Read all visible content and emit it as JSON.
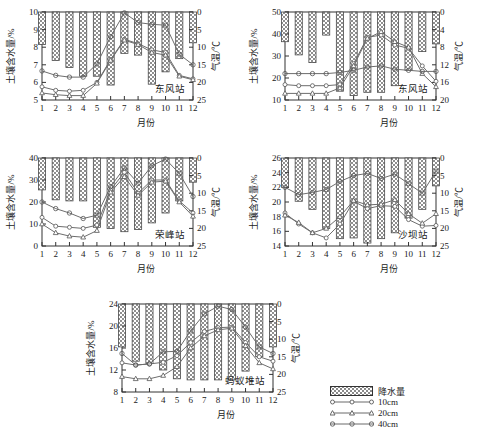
{
  "figure": {
    "axis_labels": {
      "y_left": "土壤含水量/%",
      "y_right": "气温/℃",
      "x": "月份"
    }
  },
  "legend": {
    "items": [
      {
        "label": "降水量",
        "type": "bar",
        "icon": "hatched-bar-swatch"
      },
      {
        "label": "10cm",
        "type": "line",
        "icon": "circle-marker-line"
      },
      {
        "label": "20cm",
        "type": "line",
        "icon": "triangle-marker-line"
      },
      {
        "label": "40cm",
        "type": "line",
        "icon": "circle-open-marker-line"
      }
    ]
  },
  "chart_data": [
    {
      "type": "bar",
      "title": "",
      "station": "东风站",
      "panel_index": 0,
      "xlabel": "月份",
      "ylabel": "土壤含水量/%",
      "y2label": "气温/℃",
      "categories": [
        "1",
        "2",
        "3",
        "4",
        "5",
        "6",
        "7",
        "8",
        "9",
        "10",
        "11",
        "12"
      ],
      "x": [
        1,
        2,
        3,
        4,
        5,
        6,
        7,
        8,
        9,
        10,
        11,
        12
      ],
      "ylim": [
        5,
        10
      ],
      "yticks": [
        5,
        6,
        7,
        8,
        9,
        10
      ],
      "y2lim": [
        25,
        0
      ],
      "y2ticks": [
        0,
        5,
        10,
        15,
        20,
        25
      ],
      "grid": false,
      "legend_position": "outside-bottom-right",
      "bars": {
        "name": "降水量",
        "anchor": "top",
        "values_bottom": [
          8.15,
          7.25,
          6.85,
          6.35,
          6.35,
          5.85,
          7.65,
          7.55,
          5.9,
          6.6,
          7.35,
          8.25
        ]
      },
      "series": [
        {
          "name": "10cm",
          "marker": "circle",
          "values": [
            5.75,
            5.55,
            5.5,
            5.55,
            6.0,
            7.3,
            8.45,
            8.2,
            7.85,
            7.7,
            6.4,
            6.2
          ]
        },
        {
          "name": "20cm",
          "marker": "triangle",
          "values": [
            5.4,
            5.3,
            5.25,
            5.25,
            5.95,
            7.25,
            8.4,
            8.15,
            7.7,
            7.55,
            6.35,
            6.15
          ]
        },
        {
          "name": "40cm",
          "marker": "circle-open",
          "values": [
            6.65,
            6.4,
            6.3,
            6.3,
            7.05,
            8.6,
            9.95,
            9.4,
            9.3,
            9.25,
            7.6,
            7.0
          ]
        }
      ]
    },
    {
      "type": "bar",
      "title": "",
      "station": "东风站",
      "panel_index": 1,
      "xlabel": "月份",
      "ylabel": "土壤含水量/%",
      "y2label": "气温/℃",
      "categories": [
        "1",
        "2",
        "3",
        "4",
        "5",
        "6",
        "7",
        "8",
        "9",
        "10",
        "11",
        "12"
      ],
      "x": [
        1,
        2,
        3,
        4,
        5,
        6,
        7,
        8,
        9,
        10,
        11,
        12
      ],
      "ylim": [
        10,
        50
      ],
      "yticks": [
        10,
        20,
        30,
        40,
        50
      ],
      "y2lim": [
        20,
        0
      ],
      "y2ticks": [
        0,
        4,
        8,
        12,
        16,
        20
      ],
      "grid": false,
      "legend_position": "outside-bottom-right",
      "bars": {
        "name": "降水量",
        "anchor": "top",
        "values_bottom": [
          36.5,
          30.5,
          27.0,
          39.5,
          14.0,
          12.0,
          13.5,
          13.5,
          16.5,
          23.5,
          32.0,
          35.5
        ]
      },
      "series": [
        {
          "name": "10cm",
          "marker": "circle",
          "values": [
            17.0,
            16.5,
            16.5,
            16.5,
            17.0,
            26.5,
            38.5,
            39.5,
            35.0,
            33.5,
            25.5,
            18.5
          ]
        },
        {
          "name": "20cm",
          "marker": "triangle",
          "values": [
            13.0,
            13.0,
            13.0,
            13.0,
            15.5,
            25.5,
            38.0,
            41.0,
            36.5,
            34.0,
            22.0,
            16.0
          ]
        },
        {
          "name": "40cm",
          "marker": "circle-open",
          "values": [
            22.0,
            22.0,
            22.0,
            22.0,
            22.5,
            23.5,
            25.0,
            25.5,
            24.0,
            23.5,
            23.0,
            23.0
          ]
        }
      ]
    },
    {
      "type": "bar",
      "title": "",
      "station": "荣峰站",
      "panel_index": 2,
      "xlabel": "月份",
      "ylabel": "土壤含水量/%",
      "y2label": "气温/℃",
      "categories": [
        "1",
        "2",
        "3",
        "4",
        "5",
        "6",
        "7",
        "8",
        "9",
        "10",
        "11",
        "12"
      ],
      "x": [
        1,
        2,
        3,
        4,
        5,
        6,
        7,
        8,
        9,
        10,
        11,
        12
      ],
      "ylim": [
        0,
        40
      ],
      "yticks": [
        0,
        10,
        20,
        30,
        40
      ],
      "y2lim": [
        25,
        0
      ],
      "y2ticks": [
        0,
        5,
        10,
        15,
        20,
        25
      ],
      "grid": false,
      "legend_position": "outside-bottom-right",
      "bars": {
        "name": "降水量",
        "anchor": "top",
        "values_bottom": [
          25.5,
          21.0,
          20.5,
          20.5,
          8.5,
          8.0,
          6.5,
          7.5,
          10.5,
          15.0,
          20.5,
          29.0
        ]
      },
      "series": [
        {
          "name": "10cm",
          "marker": "circle",
          "values": [
            13.0,
            9.0,
            8.5,
            8.0,
            9.5,
            25.5,
            33.5,
            24.0,
            30.0,
            30.0,
            20.5,
            15.0
          ]
        },
        {
          "name": "20cm",
          "marker": "triangle",
          "values": [
            10.0,
            6.0,
            4.5,
            4.0,
            7.0,
            24.5,
            31.5,
            23.0,
            29.0,
            29.5,
            20.0,
            13.5
          ]
        },
        {
          "name": "40cm",
          "marker": "circle-open",
          "values": [
            20.0,
            17.0,
            15.0,
            12.5,
            14.0,
            27.0,
            35.5,
            28.5,
            36.5,
            39.5,
            33.0,
            22.5
          ]
        }
      ]
    },
    {
      "type": "bar",
      "title": "",
      "station": "沙坝站",
      "panel_index": 3,
      "xlabel": "月份",
      "ylabel": "土壤含水量/%",
      "y2label": "气温/℃",
      "categories": [
        "1",
        "2",
        "3",
        "4",
        "5",
        "6",
        "7",
        "8",
        "9",
        "10",
        "11",
        "12"
      ],
      "x": [
        1,
        2,
        3,
        4,
        5,
        6,
        7,
        8,
        9,
        10,
        11,
        12
      ],
      "ylim": [
        14,
        26
      ],
      "yticks": [
        14,
        16,
        18,
        20,
        22,
        24,
        26
      ],
      "y2lim": [
        25,
        0
      ],
      "y2ticks": [
        0,
        5,
        10,
        15,
        20,
        25
      ],
      "grid": false,
      "legend_position": "outside-bottom-right",
      "bars": {
        "name": "降水量",
        "anchor": "top",
        "values_bottom": [
          22.0,
          20.1,
          19.0,
          16.4,
          15.0,
          15.1,
          14.4,
          15.0,
          15.8,
          17.8,
          19.0,
          22.2
        ]
      },
      "series": [
        {
          "name": "10cm",
          "marker": "circle",
          "values": [
            18.5,
            17.0,
            15.8,
            15.1,
            17.0,
            20.1,
            19.1,
            19.5,
            19.4,
            17.6,
            16.7,
            16.8
          ]
        },
        {
          "name": "20cm",
          "marker": "triangle",
          "values": [
            18.2,
            17.2,
            15.8,
            16.4,
            18.0,
            20.2,
            19.6,
            19.7,
            20.3,
            18.4,
            17.1,
            18.4
          ]
        },
        {
          "name": "40cm",
          "marker": "circle-open",
          "values": [
            22.0,
            21.0,
            21.3,
            21.7,
            22.8,
            23.6,
            23.9,
            23.2,
            23.8,
            22.5,
            21.2,
            24.2
          ]
        }
      ]
    },
    {
      "type": "bar",
      "title": "",
      "station": "蚂蚁堆站",
      "panel_index": 4,
      "xlabel": "月份",
      "ylabel": "土壤含水量/%",
      "y2label": "气温/℃",
      "categories": [
        "1",
        "2",
        "3",
        "4",
        "5",
        "6",
        "7",
        "8",
        "9",
        "10",
        "11",
        "12"
      ],
      "x": [
        1,
        2,
        3,
        4,
        5,
        6,
        7,
        8,
        9,
        10,
        11,
        12
      ],
      "ylim": [
        8,
        24
      ],
      "yticks": [
        8,
        12,
        16,
        20,
        24
      ],
      "y2lim": [
        25,
        0
      ],
      "y2ticks": [
        0,
        5,
        10,
        15,
        20,
        25
      ],
      "grid": false,
      "legend_position": "outside-bottom-right",
      "bars": {
        "name": "降水量",
        "anchor": "top",
        "values_bottom": [
          16.2,
          13.6,
          13.2,
          12.0,
          10.4,
          10.2,
          10.2,
          10.2,
          10.2,
          11.8,
          14.4,
          16.2
        ]
      },
      "series": [
        {
          "name": "10cm",
          "marker": "circle",
          "values": [
            13.3,
            12.9,
            13.1,
            13.4,
            14.6,
            17.0,
            19.0,
            19.7,
            19.8,
            17.0,
            14.4,
            13.6
          ]
        },
        {
          "name": "20cm",
          "marker": "triangle",
          "values": [
            10.8,
            10.4,
            10.4,
            11.0,
            12.6,
            16.0,
            18.2,
            19.3,
            19.6,
            16.4,
            13.3,
            12.2
          ]
        },
        {
          "name": "40cm",
          "marker": "circle-open",
          "values": [
            15.0,
            12.9,
            13.1,
            15.3,
            15.4,
            19.1,
            22.2,
            23.6,
            23.0,
            19.8,
            16.2,
            15.0
          ]
        }
      ]
    }
  ]
}
